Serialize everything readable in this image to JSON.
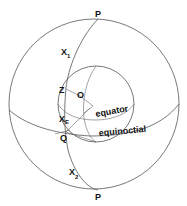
{
  "diagram": {
    "type": "celestial sphere construction",
    "labels": {
      "pole_top": "P",
      "pole_bottom": "P",
      "x1": "X",
      "x1_sub": "1",
      "z": "Z",
      "o": "O",
      "xe": "X",
      "xe_sub": "E",
      "q": "Q",
      "x2": "X",
      "x2_sub": "2",
      "equator": "equator",
      "equinoctial": "equinoctial"
    },
    "colors": {
      "line": "#555555",
      "text": "#111111",
      "background": "#ffffff"
    }
  }
}
